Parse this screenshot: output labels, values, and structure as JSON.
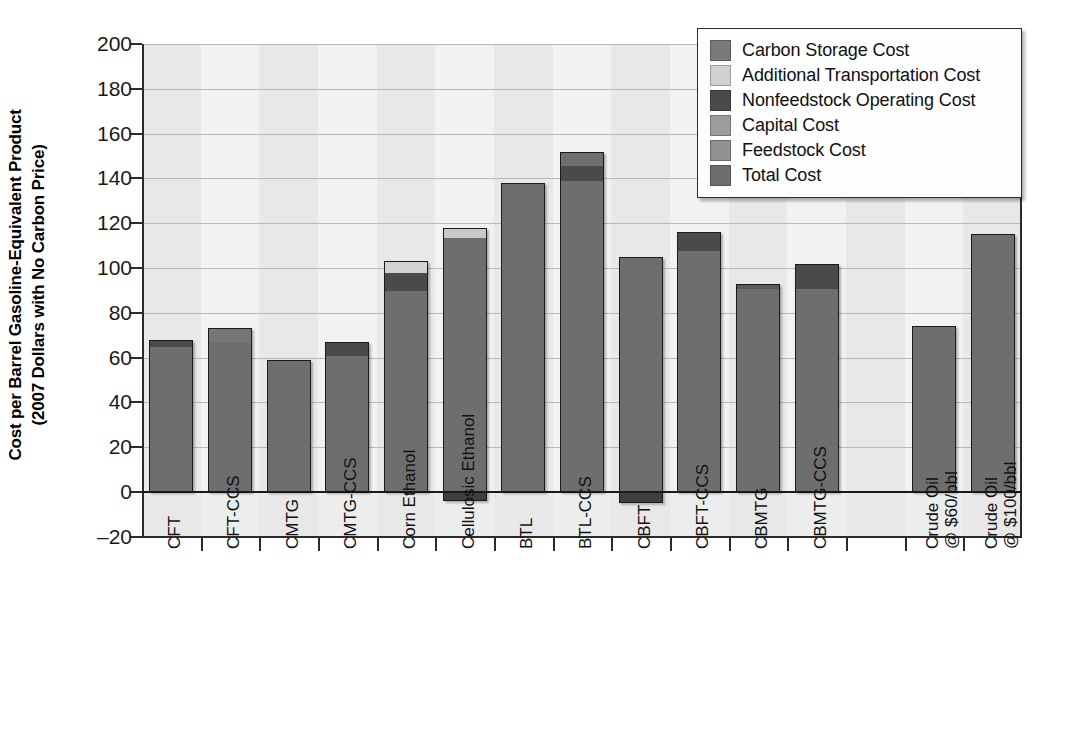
{
  "chart_data": {
    "type": "bar",
    "subtype": "stacked-bar",
    "title": "",
    "xlabel": "",
    "ylabel": "Cost per Barrel Gasoline-Equivalent Product (2007 Dollars with No Carbon Price)",
    "ylabel_line1": "Cost per Barrel Gasoline-Equivalent Product",
    "ylabel_line2": "(2007 Dollars with No Carbon Price)",
    "ylim": [
      -20,
      200
    ],
    "yticks": [
      -20,
      0,
      20,
      40,
      60,
      80,
      100,
      120,
      140,
      160,
      180,
      200
    ],
    "ytick_labels": [
      "–20",
      "0",
      "20",
      "40",
      "60",
      "80",
      "100",
      "120",
      "140",
      "160",
      "180",
      "200"
    ],
    "grid": true,
    "grid_axis": "y",
    "legend_position": "top-right",
    "categories": [
      "CFT",
      "CFT-CCS",
      "CMTG",
      "CMTG-CCS",
      "Corn Ethanol",
      "Cellulosic Ethanol",
      "BTL",
      "BTL-CCS",
      "CBFT",
      "CBFT-CCS",
      "CBMTG",
      "CBMTG-CCS",
      "",
      "Crude Oil @ $60/bbl",
      "Crude Oil @ $100/bbl"
    ],
    "category_labels": [
      {
        "line1": "CFT",
        "line2": ""
      },
      {
        "line1": "CFT-CCS",
        "line2": ""
      },
      {
        "line1": "CMTG",
        "line2": ""
      },
      {
        "line1": "CMTG-CCS",
        "line2": ""
      },
      {
        "line1": "Corn Ethanol",
        "line2": ""
      },
      {
        "line1": "Cellulosic Ethanol",
        "line2": ""
      },
      {
        "line1": "BTL",
        "line2": ""
      },
      {
        "line1": "BTL-CCS",
        "line2": ""
      },
      {
        "line1": "CBFT",
        "line2": ""
      },
      {
        "line1": "CBFT-CCS",
        "line2": ""
      },
      {
        "line1": "CBMTG",
        "line2": ""
      },
      {
        "line1": "CBMTG-CCS",
        "line2": ""
      },
      {
        "line1": "",
        "line2": ""
      },
      {
        "line1": "Crude Oil",
        "line2": "@ $60/bbl"
      },
      {
        "line1": "Crude Oil",
        "line2": "@ $100/bbl"
      }
    ],
    "series": [
      {
        "name": "Total Cost",
        "color": "#6e6e6e",
        "values": [
          65,
          67,
          59,
          61,
          90,
          114,
          138,
          139,
          108,
          108,
          91,
          91,
          null,
          74,
          115
        ]
      },
      {
        "name": "Feedstock Cost",
        "color": "#8a8a8a",
        "values": [
          0,
          6,
          0,
          0,
          0,
          0,
          0,
          0,
          0,
          0,
          0,
          0,
          null,
          0,
          0
        ]
      },
      {
        "name": "Capital Cost",
        "color": "#9a9a9a",
        "values": [
          0,
          0,
          0,
          0,
          0,
          0,
          0,
          0,
          0,
          0,
          0,
          0,
          null,
          0,
          0
        ]
      },
      {
        "name": "Nonfeedstock Operating Cost",
        "color": "#4a4a4a",
        "values": [
          3,
          0,
          0,
          6,
          8,
          0,
          0,
          13,
          -4,
          8,
          2,
          11,
          null,
          0,
          0
        ]
      },
      {
        "name": "Additional Transportation Cost",
        "color": "#d2d2d2",
        "values": [
          0,
          0,
          0,
          0,
          5,
          4,
          0,
          0,
          0,
          0,
          0,
          0,
          null,
          0,
          0
        ]
      },
      {
        "name": "Carbon Storage Cost",
        "color": "#6e6e6e",
        "values": [
          0,
          0,
          0,
          0,
          0,
          0,
          0,
          0,
          0,
          0,
          0,
          0,
          null,
          0,
          0
        ]
      }
    ],
    "bars": [
      {
        "category": "CFT",
        "total": 68,
        "segments": [
          {
            "series": "Total Cost",
            "value": 65,
            "color": "#6e6e6e"
          },
          {
            "series": "Nonfeedstock Operating Cost",
            "value": 3,
            "color": "#4a4a4a"
          }
        ]
      },
      {
        "category": "CFT-CCS",
        "total": 73,
        "segments": [
          {
            "series": "Total Cost",
            "value": 67,
            "color": "#6e6e6e"
          },
          {
            "series": "Carbon Storage Cost",
            "value": 6,
            "color": "#767676"
          }
        ]
      },
      {
        "category": "CMTG",
        "total": 59,
        "segments": [
          {
            "series": "Total Cost",
            "value": 59,
            "color": "#6e6e6e"
          }
        ]
      },
      {
        "category": "CMTG-CCS",
        "total": 67,
        "segments": [
          {
            "series": "Total Cost",
            "value": 61,
            "color": "#6e6e6e"
          },
          {
            "series": "Nonfeedstock Operating Cost",
            "value": 6,
            "color": "#4a4a4a"
          }
        ]
      },
      {
        "category": "Corn Ethanol",
        "total": 103,
        "segments": [
          {
            "series": "Total Cost",
            "value": 90,
            "color": "#6e6e6e"
          },
          {
            "series": "Nonfeedstock Operating Cost",
            "value": 8,
            "color": "#4a4a4a"
          },
          {
            "series": "Additional Transportation Cost",
            "value": 5,
            "color": "#d2d2d2"
          }
        ]
      },
      {
        "category": "Cellulosic Ethanol",
        "total": 118,
        "negative": -4,
        "segments": [
          {
            "series": "Total Cost",
            "value": 114,
            "color": "#6e6e6e"
          },
          {
            "series": "Additional Transportation Cost",
            "value": 4,
            "color": "#c9c9c9"
          }
        ]
      },
      {
        "category": "BTL",
        "total": 138,
        "segments": [
          {
            "series": "Total Cost",
            "value": 138,
            "color": "#6e6e6e"
          }
        ]
      },
      {
        "category": "BTL-CCS",
        "total": 152,
        "segments": [
          {
            "series": "Total Cost",
            "value": 139,
            "color": "#6e6e6e"
          },
          {
            "series": "Nonfeedstock Operating Cost",
            "value": 7,
            "color": "#4a4a4a"
          },
          {
            "series": "Carbon Storage Cost",
            "value": 6,
            "color": "#6e6e6e"
          }
        ]
      },
      {
        "category": "CBFT",
        "total": 105,
        "negative": -5,
        "segments": [
          {
            "series": "Total Cost",
            "value": 105,
            "color": "#6e6e6e"
          }
        ]
      },
      {
        "category": "CBFT-CCS",
        "total": 116,
        "segments": [
          {
            "series": "Total Cost",
            "value": 108,
            "color": "#6e6e6e"
          },
          {
            "series": "Nonfeedstock Operating Cost",
            "value": 8,
            "color": "#4a4a4a"
          }
        ]
      },
      {
        "category": "CBMTG",
        "total": 93,
        "segments": [
          {
            "series": "Total Cost",
            "value": 91,
            "color": "#6e6e6e"
          },
          {
            "series": "Nonfeedstock Operating Cost",
            "value": 2,
            "color": "#5a5a5a"
          }
        ]
      },
      {
        "category": "CBMTG-CCS",
        "total": 102,
        "segments": [
          {
            "series": "Total Cost",
            "value": 91,
            "color": "#6e6e6e"
          },
          {
            "series": "Nonfeedstock Operating Cost",
            "value": 11,
            "color": "#4a4a4a"
          }
        ]
      },
      {
        "category": "Crude Oil @ $60/bbl",
        "total": 74,
        "segments": [
          {
            "series": "Total Cost",
            "value": 74,
            "color": "#6e6e6e"
          }
        ]
      },
      {
        "category": "Crude Oil @ $100/bbl",
        "total": 115,
        "segments": [
          {
            "series": "Total Cost",
            "value": 115,
            "color": "#6e6e6e"
          }
        ]
      }
    ]
  },
  "legend": {
    "items": [
      {
        "label": "Carbon Storage Cost",
        "color": "#7a7a7a"
      },
      {
        "label": "Additional Transportation Cost",
        "color": "#d0d0d0"
      },
      {
        "label": "Nonfeedstock Operating Cost",
        "color": "#4a4a4a"
      },
      {
        "label": "Capital Cost",
        "color": "#9d9d9d"
      },
      {
        "label": "Feedstock Cost",
        "color": "#919191"
      },
      {
        "label": "Total Cost",
        "color": "#6e6e6e"
      }
    ]
  },
  "axes": {
    "y_title_line1": "Cost per Barrel Gasoline-Equivalent Product",
    "y_title_line2": "(2007 Dollars with No Carbon Price)"
  }
}
